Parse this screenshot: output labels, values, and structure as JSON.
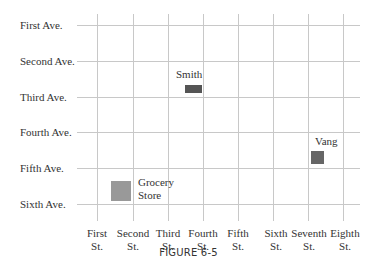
{
  "diagram": {
    "caption": "FIGURE 6-5",
    "avenues": [
      {
        "label": "First Ave.",
        "y": 25
      },
      {
        "label": "Second Ave.",
        "y": 61
      },
      {
        "label": "Third Ave.",
        "y": 97
      },
      {
        "label": "Fourth Ave.",
        "y": 132
      },
      {
        "label": "Fifth Ave.",
        "y": 168
      },
      {
        "label": "Sixth Ave.",
        "y": 204
      }
    ],
    "streets": [
      {
        "line1": "First",
        "line2": "St.",
        "x": 97
      },
      {
        "line1": "Second",
        "line2": "St.",
        "x": 133
      },
      {
        "line1": "Third",
        "line2": "St.",
        "x": 168
      },
      {
        "line1": "Fourth",
        "line2": "St.",
        "x": 203
      },
      {
        "line1": "Fifth",
        "line2": "St.",
        "x": 238
      },
      {
        "line1": "Sixth",
        "line2": "St.",
        "x": 273
      },
      {
        "line1": "Seventh",
        "line2": "St.",
        "x": 308
      },
      {
        "line1": "Eighth",
        "line2": "St.",
        "x": 343
      }
    ],
    "locations": {
      "smith": {
        "label": "Smith",
        "color": "#555555"
      },
      "vang": {
        "label": "Vang",
        "color": "#666666"
      },
      "grocery": {
        "label_line1": "Grocery",
        "label_line2": "Store",
        "color": "#999999"
      }
    }
  }
}
